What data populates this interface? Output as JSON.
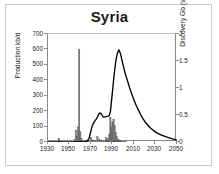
{
  "figure": {
    "title": "Syria",
    "border_color": "#c9c9c9",
    "background": "#ffffff",
    "axis_color": "#8a8a8a",
    "curve_color": "#000000",
    "shade_color": "#808080"
  },
  "axes": {
    "x": {
      "label": "",
      "min": 1930,
      "max": 2050,
      "ticks": [
        1930,
        1950,
        1970,
        1990,
        2010,
        2030,
        2050
      ],
      "tick_labels": [
        "1930",
        "1950",
        "1970",
        "1990",
        "2010",
        "2030",
        "2050"
      ]
    },
    "y_left": {
      "label": "Production kb/d",
      "min": 0,
      "max": 700,
      "ticks": [
        0,
        100,
        200,
        300,
        400,
        500,
        600,
        700
      ],
      "tick_labels": [
        "0",
        "100",
        "200",
        "300",
        "400",
        "500",
        "600",
        "700"
      ]
    },
    "y_right": {
      "label": "Discovery Gb (shaded)",
      "min": 0,
      "max": 2,
      "ticks": [
        0,
        0.5,
        1,
        1.5,
        2
      ],
      "tick_labels": [
        "0",
        "0.5",
        "1",
        "1.5",
        "2"
      ]
    }
  },
  "chart_data": {
    "type": "line",
    "title": "Syria",
    "xlabel": "",
    "ylabel": "Production kb/d",
    "y2label": "Discovery Gb (shaded)",
    "xlim": [
      1930,
      2050
    ],
    "ylim": [
      0,
      700
    ],
    "y2lim": [
      0,
      2
    ],
    "grid": false,
    "legend": "none",
    "series": [
      {
        "name": "Production kb/d",
        "type": "line",
        "axis": "left",
        "units": "kb/d",
        "x": [
          1930,
          1935,
          1940,
          1945,
          1950,
          1955,
          1960,
          1962,
          1964,
          1966,
          1968,
          1969,
          1970,
          1971,
          1972,
          1973,
          1974,
          1975,
          1976,
          1977,
          1978,
          1979,
          1980,
          1981,
          1982,
          1983,
          1984,
          1985,
          1986,
          1987,
          1988,
          1989,
          1990,
          1991,
          1992,
          1993,
          1994,
          1995,
          1996,
          1997,
          1998,
          1999,
          2000,
          2002,
          2004,
          2006,
          2008,
          2010,
          2012,
          2014,
          2016,
          2018,
          2020,
          2025,
          2030,
          2035,
          2040,
          2045,
          2050
        ],
        "y": [
          0,
          0,
          0,
          0,
          0,
          0,
          0,
          0,
          2,
          5,
          20,
          45,
          75,
          100,
          118,
          130,
          140,
          150,
          162,
          178,
          188,
          186,
          178,
          165,
          162,
          163,
          165,
          166,
          168,
          172,
          195,
          260,
          330,
          400,
          465,
          520,
          560,
          585,
          597,
          580,
          555,
          525,
          495,
          440,
          395,
          350,
          310,
          272,
          238,
          208,
          180,
          155,
          133,
          92,
          64,
          46,
          33,
          22,
          12
        ]
      },
      {
        "name": "Discovery Gb",
        "type": "bar",
        "axis": "right",
        "units": "Gb",
        "shaded": true,
        "x": [
          1940,
          1941,
          1955,
          1956,
          1957,
          1958,
          1959,
          1960,
          1961,
          1962,
          1966,
          1968,
          1970,
          1972,
          1974,
          1976,
          1978,
          1980,
          1982,
          1984,
          1985,
          1986,
          1987,
          1988,
          1989,
          1990,
          1991,
          1992,
          1993,
          1994,
          1995,
          1996,
          1997,
          1998,
          2000,
          2002
        ],
        "y": [
          0.07,
          0.02,
          0.05,
          0.22,
          0.1,
          0.28,
          1.72,
          0.19,
          0.06,
          0.03,
          0.02,
          0.03,
          0.09,
          0.04,
          0.02,
          0.1,
          0.05,
          0.03,
          0.02,
          0.09,
          0.03,
          0.06,
          0.14,
          0.46,
          0.27,
          0.37,
          0.42,
          0.3,
          0.18,
          0.1,
          0.05,
          0.04,
          0.03,
          0.02,
          0.01,
          0.01
        ]
      }
    ],
    "annotations": [
      {
        "text": "Discovery peak spike ~1.7 Gb near 1959"
      },
      {
        "text": "Production peak ~597 kb/d near 1996"
      }
    ]
  }
}
